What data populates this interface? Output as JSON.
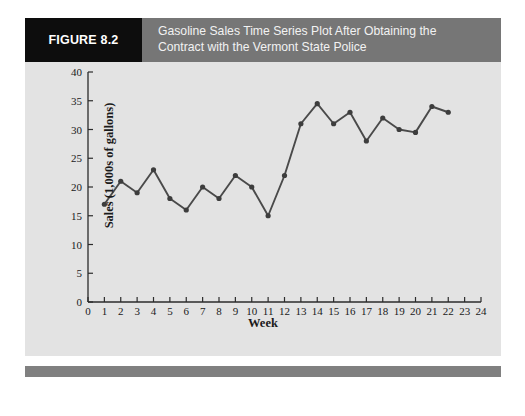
{
  "figure": {
    "label": "FIGURE 8.2",
    "title_line1": "Gasoline Sales Time Series Plot After Obtaining the",
    "title_line2": "Contract with the Vermont State Police",
    "label_bg": "#0d0d0d",
    "header_bg": "#767676",
    "panel_bg": "#e3e3e3",
    "footer_bg": "#808080"
  },
  "chart_data": {
    "type": "line",
    "title": "Gasoline Sales Time Series Plot After Obtaining the Contract with the Vermont State Police",
    "xlabel": "Week",
    "ylabel": "Sales (1,000s of gallons)",
    "xlim": [
      0,
      24
    ],
    "ylim": [
      0,
      40
    ],
    "xticks": [
      0,
      1,
      2,
      3,
      4,
      5,
      6,
      7,
      8,
      9,
      10,
      11,
      12,
      13,
      14,
      15,
      16,
      17,
      18,
      19,
      20,
      21,
      22,
      23,
      24
    ],
    "yticks": [
      0,
      5,
      10,
      15,
      20,
      25,
      30,
      35,
      40
    ],
    "grid": false,
    "legend": null,
    "marker": "circle",
    "line_color": "#4a4a4a",
    "marker_color": "#3d3d3d",
    "x": [
      1,
      2,
      3,
      4,
      5,
      6,
      7,
      8,
      9,
      10,
      11,
      12,
      13,
      14,
      15,
      16,
      17,
      18,
      19,
      20,
      21,
      22
    ],
    "values": [
      17,
      21,
      19,
      23,
      18,
      16,
      20,
      18,
      22,
      20,
      15,
      22,
      31,
      34.5,
      31,
      33,
      28,
      32,
      30,
      29.5,
      34,
      33
    ],
    "series": [
      {
        "name": "Gasoline Sales",
        "values": [
          17,
          21,
          19,
          23,
          18,
          16,
          20,
          18,
          22,
          20,
          15,
          22,
          31,
          34.5,
          31,
          33,
          28,
          32,
          30,
          29.5,
          34,
          33
        ]
      }
    ]
  }
}
